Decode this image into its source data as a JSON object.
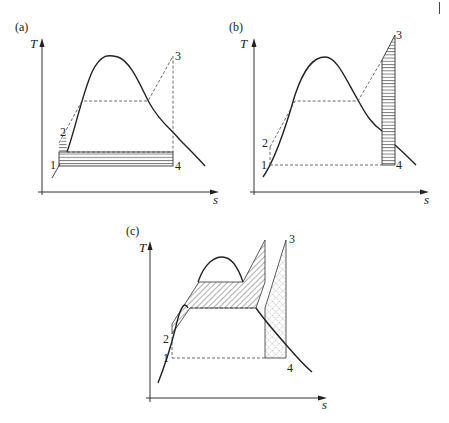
{
  "figure": {
    "page_mark": "|",
    "panels": [
      {
        "id": "a",
        "label": "(a)",
        "y_axis": "T",
        "x_axis": "s",
        "points": {
          "p1": "1",
          "p2": "2",
          "p3": "3",
          "p4": "4"
        },
        "shading": "horizontal hatching below vaporization line (heat rejection region)"
      },
      {
        "id": "b",
        "label": "(b)",
        "y_axis": "T",
        "x_axis": "s",
        "points": {
          "p1": "1",
          "p2": "2",
          "p3": "3",
          "p4": "4"
        },
        "shading": "horizontal hatching in vertical strip at right (superheat region)"
      },
      {
        "id": "c",
        "label": "(c)",
        "y_axis": "T",
        "x_axis": "s",
        "points": {
          "p1": "1",
          "p2": "2",
          "p3": "3",
          "p4": "4"
        },
        "shading": "diagonal hatching (exergy loss regions) and cross-hatched strip at right"
      }
    ]
  }
}
